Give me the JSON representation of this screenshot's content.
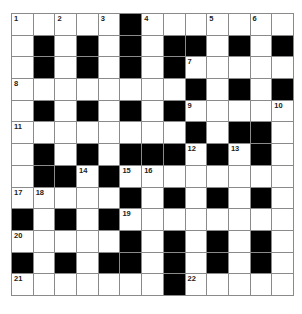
{
  "puzzle": {
    "size": 13,
    "colors": {
      "block": "#000000",
      "cell": "#ffffff",
      "gridline": "#8a8a8a"
    },
    "rows": [
      "..... #.......",
      "",
      "",
      "",
      "",
      "",
      "",
      "",
      "",
      "",
      "",
      "",
      ""
    ],
    "grid": [
      [
        "1",
        ".",
        "2",
        ".",
        "3",
        "#",
        "4",
        ".",
        ".",
        "5",
        ".",
        "6",
        "."
      ],
      [
        ".",
        "#",
        ".",
        "#",
        ".",
        "#",
        ".",
        "#",
        "#",
        ".",
        "#",
        ".",
        "#"
      ],
      [
        ".",
        "#",
        ".",
        "#",
        ".",
        "#",
        ".",
        "#",
        "7",
        ".",
        ".",
        ".",
        "."
      ],
      [
        "8",
        ".",
        ".",
        ".",
        ".",
        ".",
        ".",
        ".",
        "#",
        ".",
        "#",
        ".",
        "#"
      ],
      [
        ".",
        "#",
        ".",
        "#",
        ".",
        "#",
        ".",
        "#",
        "9",
        ".",
        ".",
        ".",
        "10"
      ],
      [
        "11",
        ".",
        ".",
        ".",
        ".",
        ".",
        ".",
        ".",
        "#",
        ".",
        "#",
        "#",
        "."
      ],
      [
        ".",
        "#",
        ".",
        "#",
        ".",
        "#",
        "#",
        "#",
        "12",
        "#",
        "13",
        "#",
        "."
      ],
      [
        ".",
        "#",
        "#",
        "14",
        "#",
        "15",
        "16",
        ".",
        ".",
        ".",
        ".",
        ".",
        "."
      ],
      [
        "17",
        "18",
        ".",
        ".",
        ".",
        "#",
        ".",
        "#",
        ".",
        "#",
        ".",
        "#",
        "."
      ],
      [
        "#",
        ".",
        "#",
        ".",
        "#",
        "19",
        ".",
        ".",
        ".",
        ".",
        ".",
        ".",
        "."
      ],
      [
        "20",
        ".",
        ".",
        ".",
        ".",
        "#",
        ".",
        "#",
        ".",
        "#",
        ".",
        "#",
        "."
      ],
      [
        "#",
        ".",
        "#",
        ".",
        "#",
        "#",
        ".",
        "#",
        ".",
        "#",
        ".",
        "#",
        "."
      ],
      [
        "21",
        ".",
        ".",
        ".",
        ".",
        ".",
        ".",
        "#",
        "22",
        ".",
        ".",
        ".",
        "."
      ]
    ]
  }
}
